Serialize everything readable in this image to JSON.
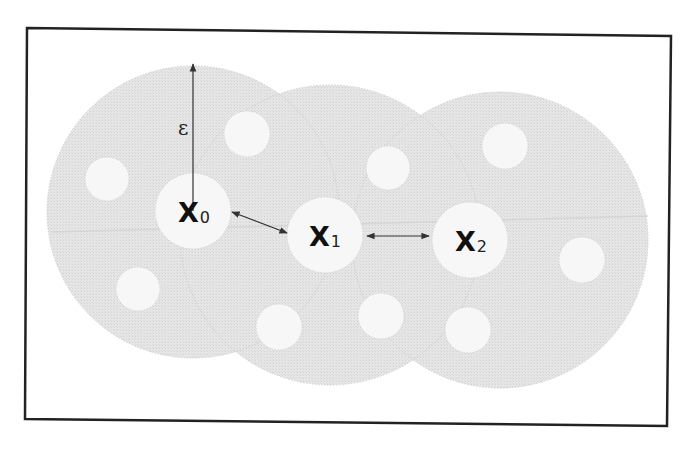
{
  "figure": {
    "type": "density-reachability-diagram",
    "background": "#ffffff",
    "frame": {
      "stroke": "#222222",
      "stroke_width": 2.5,
      "corners": [
        [
          27,
          28
        ],
        [
          671,
          36
        ],
        [
          667,
          426
        ],
        [
          25,
          419
        ]
      ]
    },
    "colors": {
      "neighborhood_fill": "#e4e4e4",
      "neighborhood_edge": "#cfcfcf",
      "point_fill": "#f7f7f7",
      "point_edge": "#d6d6d6",
      "arrow": "#333333",
      "text": "#111111",
      "seam": "#d0d0d0"
    },
    "neighborhoods": [
      {
        "id": "n0",
        "cx": 193,
        "cy": 212,
        "r": 146
      },
      {
        "id": "n1",
        "cx": 330,
        "cy": 235,
        "r": 150
      },
      {
        "id": "n2",
        "cx": 500,
        "cy": 240,
        "r": 148
      }
    ],
    "core_points": [
      {
        "id": "x0",
        "cx": 193,
        "cy": 211,
        "r": 38,
        "label": "X",
        "subscript": "0"
      },
      {
        "id": "x1",
        "cx": 325,
        "cy": 235,
        "r": 38,
        "label": "X",
        "subscript": "1"
      },
      {
        "id": "x2",
        "cx": 470,
        "cy": 240,
        "r": 38,
        "label": "X",
        "subscript": "2"
      }
    ],
    "neighbor_points": [
      {
        "cx": 107,
        "cy": 179,
        "r": 22
      },
      {
        "cx": 247,
        "cy": 134,
        "r": 23
      },
      {
        "cx": 138,
        "cy": 289,
        "r": 22
      },
      {
        "cx": 388,
        "cy": 168,
        "r": 22
      },
      {
        "cx": 505,
        "cy": 146,
        "r": 23
      },
      {
        "cx": 279,
        "cy": 327,
        "r": 23
      },
      {
        "cx": 381,
        "cy": 316,
        "r": 23
      },
      {
        "cx": 468,
        "cy": 330,
        "r": 23
      },
      {
        "cx": 582,
        "cy": 260,
        "r": 23
      }
    ],
    "radius_arrow": {
      "label": "ε",
      "x1": 193,
      "y1": 211,
      "x2": 193,
      "y2": 64,
      "label_x": 178,
      "label_y": 135
    },
    "links": [
      {
        "from": "x0",
        "to": "x1",
        "x1": 232,
        "y1": 212,
        "x2": 287,
        "y2": 233,
        "bidirectional": true
      },
      {
        "from": "x1",
        "to": "x2",
        "x1": 367,
        "y1": 236,
        "x2": 429,
        "y2": 236,
        "bidirectional": true
      }
    ],
    "labels": {
      "epsilon": "ε",
      "x0_main": "X",
      "x0_sub": "0",
      "x1_main": "X",
      "x1_sub": "1",
      "x2_main": "X",
      "x2_sub": "2"
    }
  }
}
